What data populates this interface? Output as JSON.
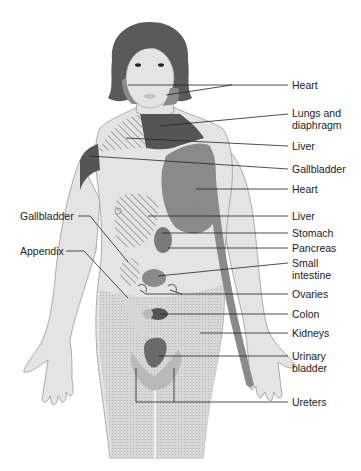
{
  "figure": {
    "colors": {
      "skin": "#e4e4e4",
      "outline": "#9a9a9a",
      "hair": "#5a5a5a",
      "dark_region": "#555555",
      "medium_region": "#8a8a8a",
      "light_region": "#b9b9b9",
      "stipple": "#d2d2d2",
      "leader_line": "#222222"
    }
  },
  "labels_right": [
    {
      "id": "heart-face",
      "text": "Heart"
    },
    {
      "id": "lungs",
      "text": "Lungs and diaphragm"
    },
    {
      "id": "liver-shoulder",
      "text": "Liver"
    },
    {
      "id": "gallbladder-shoulder",
      "text": "Gallbladder"
    },
    {
      "id": "heart-chest",
      "text": "Heart"
    },
    {
      "id": "liver-abdomen",
      "text": "Liver"
    },
    {
      "id": "stomach",
      "text": "Stomach"
    },
    {
      "id": "pancreas",
      "text": "Pancreas"
    },
    {
      "id": "small-intestine",
      "text": "Small intestine"
    },
    {
      "id": "ovaries",
      "text": "Ovaries"
    },
    {
      "id": "colon",
      "text": "Colon"
    },
    {
      "id": "kidneys",
      "text": "Kidneys"
    },
    {
      "id": "urinary-bladder",
      "text": "Urinary bladder"
    },
    {
      "id": "ureters",
      "text": "Ureters"
    }
  ],
  "labels_left": [
    {
      "id": "gallbladder-abdomen",
      "text": "Gallbladder"
    },
    {
      "id": "appendix",
      "text": "Appendix"
    }
  ]
}
